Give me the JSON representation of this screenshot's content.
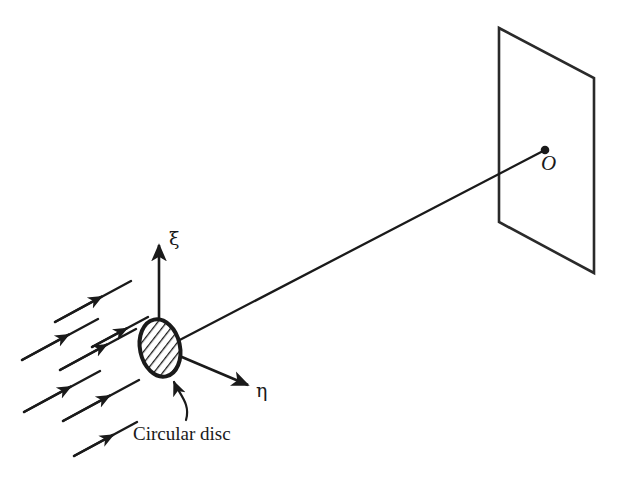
{
  "figure": {
    "type": "optics-diffraction-schematic",
    "background_color": "#ffffff",
    "stroke_color": "#1a1a1a",
    "width": 622,
    "height": 481
  },
  "labels": {
    "xi_axis": "ξ",
    "eta_axis": "η",
    "origin_point": "O",
    "disc_caption": "Circular disc"
  },
  "elements": {
    "screen": {
      "name": "observation-screen",
      "shape": "parallelogram",
      "corners": [
        [
          499,
          28
        ],
        [
          594,
          78
        ],
        [
          594,
          273
        ],
        [
          499,
          222
        ]
      ]
    },
    "disc": {
      "name": "circular-disc",
      "shape": "hatched-ellipse",
      "center": [
        160,
        348
      ],
      "radius_x": 21,
      "radius_y": 30,
      "rotation_deg": -12,
      "hatch": "diagonal"
    },
    "origin_dot": {
      "name": "origin-marker",
      "center": [
        545,
        150
      ],
      "radius": 4
    },
    "xi_axis": {
      "name": "xi-axis-arrow",
      "from": [
        159,
        348
      ],
      "to": [
        159,
        243
      ]
    },
    "eta_axis": {
      "name": "eta-axis-arrow",
      "from": [
        163,
        349
      ],
      "to": [
        250,
        386
      ]
    },
    "sight_line": {
      "name": "axis-line-to-origin",
      "from": [
        172,
        344
      ],
      "to": [
        545,
        150
      ]
    },
    "leader": {
      "name": "disc-caption-leader",
      "from": [
        186,
        418
      ],
      "to": [
        172,
        374
      ],
      "arrowhead": true
    },
    "incident_rays": {
      "name": "incident-plane-wave-rays",
      "count": 7,
      "direction_deg": -28,
      "lines": [
        {
          "from": [
            55,
            322
          ],
          "to": [
            131,
            281
          ],
          "arrow_at": 0.6
        },
        {
          "from": [
            22,
            360
          ],
          "to": [
            98,
            319
          ],
          "arrow_at": 0.6
        },
        {
          "from": [
            60,
            370
          ],
          "to": [
            136,
            329
          ],
          "arrow_at": 0.6
        },
        {
          "from": [
            92,
            347
          ],
          "to": [
            148,
            317
          ],
          "arrow_at": 0.62
        },
        {
          "from": [
            24,
            412
          ],
          "to": [
            100,
            371
          ],
          "arrow_at": 0.6
        },
        {
          "from": [
            63,
            421
          ],
          "to": [
            139,
            380
          ],
          "arrow_at": 0.6
        },
        {
          "from": [
            74,
            456
          ],
          "to": [
            137,
            422
          ],
          "arrow_at": 0.62
        }
      ]
    }
  }
}
